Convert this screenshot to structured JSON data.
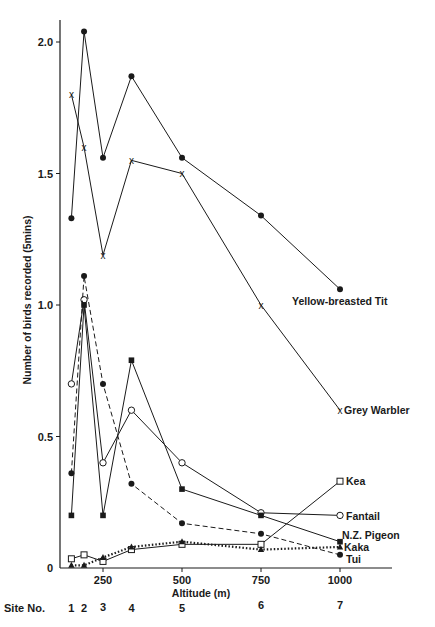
{
  "chart_data": {
    "type": "line",
    "title": "",
    "xlabel": "Altitude (m)",
    "ylabel": "Number of birds recorded (5mins)",
    "xlim": [
      0,
      1150
    ],
    "ylim": [
      0,
      2.1
    ],
    "x_ticks": [
      250,
      500,
      750,
      1000
    ],
    "y_ticks": [
      {
        "value": 0,
        "label": "0"
      },
      {
        "value": 0.5,
        "label": "0.5"
      },
      {
        "value": 1.0,
        "label": "1.0"
      },
      {
        "value": 1.5,
        "label": "1.5"
      },
      {
        "value": 2.0,
        "label": "2.0"
      }
    ],
    "grid": false,
    "legend_position": "inline-right",
    "site_row_label": "Site No.",
    "sites": [
      "1",
      "2",
      "3",
      "4",
      "5",
      "6",
      "7"
    ],
    "x": [
      150,
      190,
      250,
      340,
      500,
      750,
      1000
    ],
    "series": [
      {
        "name": "Yellow-breasted Tit",
        "marker": "filled-circle",
        "line": "solid",
        "values": [
          1.33,
          2.04,
          1.56,
          1.87,
          1.56,
          1.34,
          1.06
        ]
      },
      {
        "name": "Grey Warbler",
        "marker": "x",
        "line": "solid",
        "values": [
          1.8,
          1.6,
          1.19,
          1.55,
          1.5,
          1.0,
          0.6
        ]
      },
      {
        "name": "Kea",
        "marker": "open-square",
        "line": "solid",
        "values": [
          0.035,
          0.05,
          0.025,
          0.07,
          0.09,
          0.09,
          0.33
        ]
      },
      {
        "name": "Fantail",
        "marker": "open-circle",
        "line": "solid",
        "values": [
          0.7,
          1.02,
          0.4,
          0.6,
          0.4,
          0.21,
          0.2
        ]
      },
      {
        "name": "N.Z. Pigeon",
        "marker": "filled-square",
        "line": "solid",
        "values": [
          0.2,
          1.0,
          0.2,
          0.79,
          0.3,
          0.2,
          0.1
        ]
      },
      {
        "name": "Kaka",
        "marker": "filled-triangle",
        "line": "dotted",
        "values": [
          0.01,
          0.01,
          0.04,
          0.08,
          0.1,
          0.07,
          0.08
        ]
      },
      {
        "name": "Tui",
        "marker": "filled-circle",
        "line": "dashed",
        "values": [
          0.36,
          1.11,
          0.7,
          0.32,
          0.17,
          0.13,
          0.05
        ]
      }
    ]
  }
}
